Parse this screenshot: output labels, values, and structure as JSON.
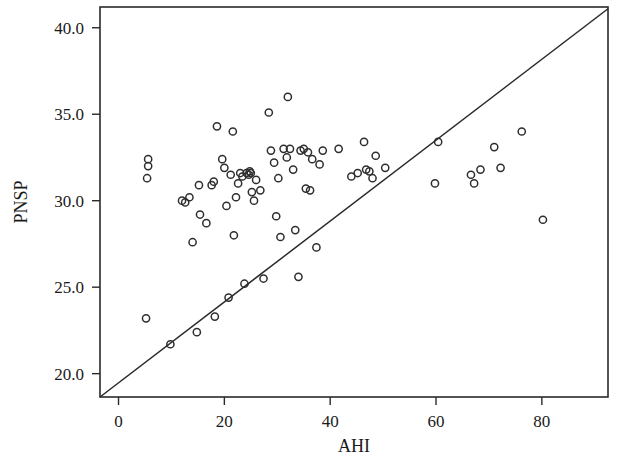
{
  "chart_data": {
    "type": "scatter",
    "title": "",
    "subtitle": "",
    "xlabel": "AHI",
    "ylabel": "PNSP",
    "xlim": [
      -3.5,
      92.5
    ],
    "ylim": [
      18.65,
      41.2
    ],
    "xticks": [
      0,
      20,
      40,
      60,
      80
    ],
    "xtick_labels": [
      "0",
      "20",
      "40",
      "60",
      "80"
    ],
    "yticks": [
      20.0,
      25.0,
      30.0,
      35.0,
      40.0
    ],
    "ytick_labels": [
      "20.0",
      "25.0",
      "30.0",
      "35.0",
      "40.0"
    ],
    "grid": false,
    "legend": null,
    "marker": "open-circle",
    "marker_color": "#2e2e2e",
    "reference_line": {
      "name": "identity-diagonal",
      "description": "straight line from lower-left corner to upper-right corner of plot frame",
      "x_start": -3.5,
      "y_start": 18.65,
      "x_end": 92.5,
      "y_end": 41.1,
      "color": "#2a2a2a"
    },
    "points": [
      [
        5.6,
        32.4
      ],
      [
        5.6,
        32.0
      ],
      [
        5.4,
        31.3
      ],
      [
        5.2,
        23.2
      ],
      [
        9.8,
        21.7
      ],
      [
        12.0,
        30.0
      ],
      [
        12.6,
        29.9
      ],
      [
        13.4,
        30.2
      ],
      [
        14.0,
        27.6
      ],
      [
        14.8,
        22.4
      ],
      [
        15.2,
        30.9
      ],
      [
        15.4,
        29.2
      ],
      [
        16.6,
        28.7
      ],
      [
        17.6,
        30.9
      ],
      [
        18.0,
        31.1
      ],
      [
        18.2,
        23.3
      ],
      [
        18.6,
        34.3
      ],
      [
        19.6,
        32.4
      ],
      [
        20.0,
        31.9
      ],
      [
        20.4,
        29.7
      ],
      [
        20.8,
        24.4
      ],
      [
        21.2,
        31.5
      ],
      [
        21.6,
        34.0
      ],
      [
        21.8,
        28.0
      ],
      [
        22.2,
        30.2
      ],
      [
        22.6,
        31.0
      ],
      [
        23.0,
        31.6
      ],
      [
        23.4,
        31.4
      ],
      [
        23.8,
        25.2
      ],
      [
        24.2,
        31.6
      ],
      [
        24.6,
        31.5
      ],
      [
        24.8,
        31.7
      ],
      [
        25.0,
        31.6
      ],
      [
        25.2,
        30.5
      ],
      [
        25.6,
        30.0
      ],
      [
        26.0,
        31.2
      ],
      [
        26.8,
        30.6
      ],
      [
        27.4,
        25.5
      ],
      [
        28.4,
        35.1
      ],
      [
        28.8,
        32.9
      ],
      [
        29.4,
        32.2
      ],
      [
        29.8,
        29.1
      ],
      [
        30.2,
        31.3
      ],
      [
        30.6,
        27.9
      ],
      [
        31.2,
        33.0
      ],
      [
        31.8,
        32.5
      ],
      [
        32.0,
        36.0
      ],
      [
        32.4,
        33.0
      ],
      [
        33.0,
        31.8
      ],
      [
        33.4,
        28.3
      ],
      [
        34.0,
        25.6
      ],
      [
        34.4,
        32.9
      ],
      [
        35.0,
        33.0
      ],
      [
        35.4,
        30.7
      ],
      [
        35.8,
        32.8
      ],
      [
        36.2,
        30.6
      ],
      [
        36.6,
        32.4
      ],
      [
        37.4,
        27.3
      ],
      [
        38.0,
        32.1
      ],
      [
        38.6,
        32.9
      ],
      [
        41.6,
        33.0
      ],
      [
        44.0,
        31.4
      ],
      [
        45.2,
        31.6
      ],
      [
        46.4,
        33.4
      ],
      [
        46.8,
        31.8
      ],
      [
        47.4,
        31.7
      ],
      [
        48.0,
        31.3
      ],
      [
        48.6,
        32.6
      ],
      [
        50.4,
        31.9
      ],
      [
        59.8,
        31.0
      ],
      [
        60.4,
        33.4
      ],
      [
        66.6,
        31.5
      ],
      [
        67.2,
        31.0
      ],
      [
        68.4,
        31.8
      ],
      [
        71.0,
        33.1
      ],
      [
        72.2,
        31.9
      ],
      [
        76.2,
        34.0
      ],
      [
        80.2,
        28.9
      ]
    ],
    "n_points": 78
  }
}
